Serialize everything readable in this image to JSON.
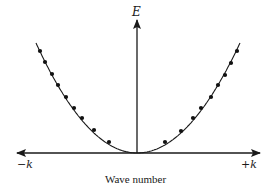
{
  "diagram": {
    "axes": {
      "vertical_label": "E",
      "horizontal_left_label": "−k",
      "horizontal_right_label": "+k",
      "horizontal_title": "Wave number"
    },
    "colors": {
      "line": "#1a1a1a",
      "dot": "#111111",
      "background": "#ffffff"
    },
    "geometry": {
      "origin": [
        137,
        153
      ],
      "vertical_axis_top": 20,
      "horizontal_axis_left": 16,
      "horizontal_axis_right": 260,
      "curve_left_start": [
        36,
        43
      ],
      "curve_right_end": [
        240,
        43
      ]
    },
    "points": {
      "left": [
        [
          40,
          51
        ],
        [
          45,
          62
        ],
        [
          52,
          74
        ],
        [
          58,
          85
        ],
        [
          66,
          97
        ],
        [
          74,
          108
        ],
        [
          82,
          118
        ],
        [
          94,
          130
        ],
        [
          109,
          142
        ]
      ],
      "right": [
        [
          165,
          142
        ],
        [
          181,
          131
        ],
        [
          193,
          118
        ],
        [
          201,
          108
        ],
        [
          211,
          97
        ],
        [
          218,
          85
        ],
        [
          225,
          75
        ],
        [
          231,
          63
        ],
        [
          237,
          51
        ]
      ]
    }
  }
}
